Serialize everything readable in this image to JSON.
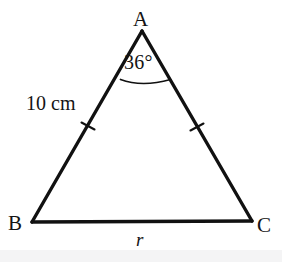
{
  "figure": {
    "kind": "isosceles-triangle-diagram",
    "background_color": "#ffffff",
    "stroke_color": "#111111",
    "bottom_strip_color": "#f4f4f5",
    "vertices": {
      "A": {
        "label": "A",
        "x": 142,
        "y": 31
      },
      "B": {
        "label": "B",
        "x": 32,
        "y": 222
      },
      "C": {
        "label": "C",
        "x": 252,
        "y": 221
      }
    },
    "angle_marks": [
      {
        "at_vertex": "A",
        "label": "36°",
        "value": 36,
        "unit": "degrees",
        "arc_radius": 48
      }
    ],
    "side_labels": [
      {
        "side": "AB",
        "label": "10 cm",
        "value": 10,
        "unit": "cm",
        "tick_count": 1
      },
      {
        "side": "AC",
        "label": "",
        "tick_count": 1
      },
      {
        "side": "BC",
        "label": "r",
        "value": null,
        "unit": "",
        "tick_count": 0
      }
    ],
    "congruence_ticks": [
      {
        "on_side": "AB",
        "x": 88,
        "y": 126
      },
      {
        "on_side": "AC",
        "x": 197,
        "y": 127
      }
    ]
  }
}
